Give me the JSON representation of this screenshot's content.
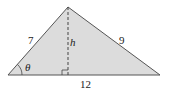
{
  "diagram": {
    "type": "triangle",
    "fill_color": "#dcdcdc",
    "stroke_color": "#555555",
    "vertices": {
      "left": [
        8,
        75
      ],
      "apex": [
        68,
        7
      ],
      "right": [
        160,
        75
      ]
    },
    "labels": {
      "left_side": "7",
      "right_side": "9",
      "base": "12",
      "height": "h",
      "angle": "θ"
    },
    "height_line": {
      "style": "dashed",
      "from": [
        68,
        7
      ],
      "to": [
        68,
        75
      ]
    },
    "right_angle_marker": true
  }
}
